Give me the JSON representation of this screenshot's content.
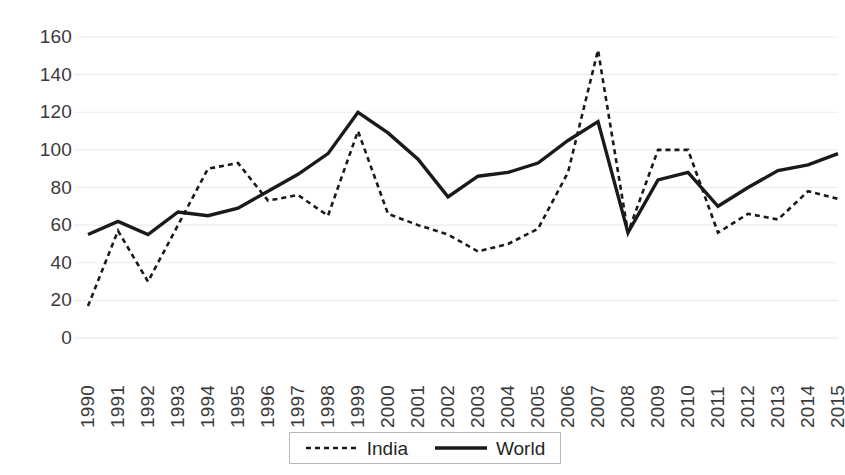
{
  "chart_data": {
    "type": "line",
    "title": "",
    "xlabel": "",
    "ylabel": "",
    "ylim": [
      0,
      160
    ],
    "ytick_step": 20,
    "grid": true,
    "legend_position": "bottom",
    "categories": [
      "1990",
      "1991",
      "1992",
      "1993",
      "1994",
      "1995",
      "1996",
      "1997",
      "1998",
      "1999",
      "2000",
      "2001",
      "2002",
      "2003",
      "2004",
      "2005",
      "2006",
      "2007",
      "2008",
      "2009",
      "2010",
      "2011",
      "2012",
      "2013",
      "2014",
      "2015"
    ],
    "ytick_labels": [
      "160",
      "140",
      "120",
      "100",
      "80",
      "60",
      "40",
      "20",
      "0"
    ],
    "ytick_values": [
      160,
      140,
      120,
      100,
      80,
      60,
      40,
      20,
      0
    ],
    "series": [
      {
        "name": "India",
        "style": "dashed",
        "color": "#1a1a1a",
        "values": [
          17,
          57,
          30,
          60,
          90,
          93,
          73,
          76,
          65,
          110,
          66,
          60,
          55,
          46,
          50,
          58,
          88,
          153,
          56,
          100,
          100,
          56,
          66,
          63,
          78,
          74
        ]
      },
      {
        "name": "World",
        "style": "solid",
        "color": "#1a1a1a",
        "values": [
          55,
          62,
          55,
          67,
          65,
          69,
          78,
          87,
          98,
          120,
          109,
          95,
          75,
          86,
          88,
          93,
          105,
          115,
          56,
          84,
          88,
          70,
          80,
          89,
          92,
          98
        ]
      }
    ]
  },
  "legend": {
    "entries": [
      {
        "label": "India",
        "style": "dashed"
      },
      {
        "label": "World",
        "style": "solid"
      }
    ]
  },
  "colors": {
    "grid": "#ececec",
    "line": "#1a1a1a",
    "text": "#3b3b3b",
    "legend_border": "#b9b9b9",
    "background": "#ffffff"
  }
}
